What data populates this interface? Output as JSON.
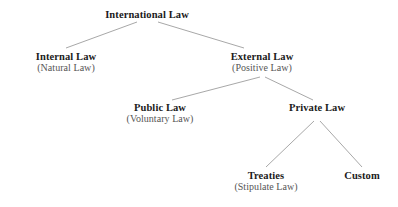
{
  "diagram": {
    "type": "hierarchy-tree",
    "background_color": "#ffffff",
    "title_color": "#1b1b1b",
    "subtitle_color": "#565656",
    "connector_color": "#a8a8a8",
    "nodes": [
      {
        "id": "international-law",
        "title": "International Law",
        "subtitle": "",
        "level": 0,
        "cx": 147,
        "top": 9
      },
      {
        "id": "internal-law",
        "title": "Internal Law",
        "subtitle": "(Natural Law)",
        "level": 1,
        "cx": 66,
        "top": 51
      },
      {
        "id": "external-law",
        "title": "External Law",
        "subtitle": "(Positive Law)",
        "level": 1,
        "cx": 262,
        "top": 51
      },
      {
        "id": "public-law",
        "title": "Public Law",
        "subtitle": "(Voluntary Law)",
        "level": 2,
        "cx": 160,
        "top": 102
      },
      {
        "id": "private-law",
        "title": "Private Law",
        "subtitle": "",
        "level": 2,
        "cx": 317,
        "top": 102
      },
      {
        "id": "treaties",
        "title": "Treaties",
        "subtitle": "(Stipulate Law)",
        "level": 3,
        "cx": 266,
        "top": 170
      },
      {
        "id": "custom",
        "title": "Custom",
        "subtitle": "",
        "level": 3,
        "cx": 362,
        "top": 170
      }
    ],
    "edges": [
      {
        "id": "edge-international-to-internal",
        "from": "international-law",
        "to": "internal-law",
        "x1": 137,
        "y1": 22,
        "x2": 66,
        "y2": 48
      },
      {
        "id": "edge-international-to-external",
        "from": "international-law",
        "to": "external-law",
        "x1": 158,
        "y1": 22,
        "x2": 244,
        "y2": 48
      },
      {
        "id": "edge-external-to-public",
        "from": "external-law",
        "to": "public-law",
        "x1": 260,
        "y1": 77,
        "x2": 172,
        "y2": 100
      },
      {
        "id": "edge-external-to-private",
        "from": "external-law",
        "to": "private-law",
        "x1": 265,
        "y1": 77,
        "x2": 313,
        "y2": 100
      },
      {
        "id": "edge-private-to-treaties",
        "from": "private-law",
        "to": "treaties",
        "x1": 314,
        "y1": 121,
        "x2": 266,
        "y2": 167
      },
      {
        "id": "edge-private-to-custom",
        "from": "private-law",
        "to": "custom",
        "x1": 320,
        "y1": 121,
        "x2": 362,
        "y2": 167
      }
    ]
  }
}
